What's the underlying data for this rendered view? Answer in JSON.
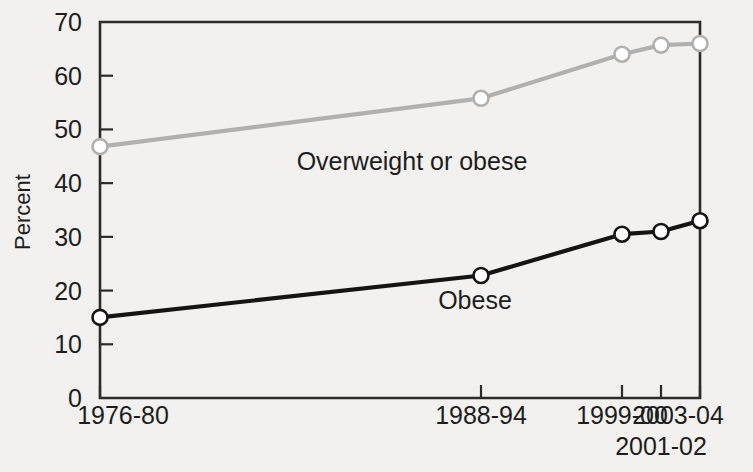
{
  "chart_data": {
    "type": "line",
    "title": "",
    "xlabel": "",
    "ylabel": "Percent",
    "ylim": [
      0,
      70
    ],
    "ytick_step": 10,
    "grid": false,
    "legend_position": "inline-annotations",
    "categories": [
      "1976-80",
      "1988-94",
      "1999-00",
      "2001-02",
      "2003-04"
    ],
    "category_positions": [
      0.0,
      0.635,
      0.87,
      0.935,
      1.0
    ],
    "yticks": [
      "0",
      "10",
      "20",
      "30",
      "40",
      "50",
      "60",
      "70"
    ],
    "series": [
      {
        "name": "Overweight or obese",
        "color": "#b0b0b0",
        "marker": "open-circle",
        "values": [
          46.8,
          55.8,
          64.0,
          65.7,
          66.0
        ]
      },
      {
        "name": "Obese",
        "color": "#141414",
        "marker": "open-circle",
        "values": [
          15.0,
          22.8,
          30.5,
          31.0,
          33.0
        ]
      }
    ],
    "annotations": [
      {
        "text": "Overweight or obese",
        "x": 0.52,
        "y": 42.5
      },
      {
        "text": "Obese",
        "x": 0.625,
        "y": 16.5
      }
    ],
    "xtick_second_row": {
      "label": "2001-02",
      "category_index": 3
    }
  },
  "colors": {
    "background": "#f2f1ef",
    "axis": "#2b2b2b",
    "text": "#1d1d1d",
    "series_overweight": "#b0b0b0",
    "series_obese": "#141414",
    "marker_fill": "#ffffff"
  }
}
